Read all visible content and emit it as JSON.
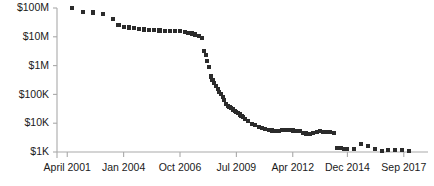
{
  "chart_data": {
    "type": "scatter",
    "title": "",
    "subtitle": "",
    "xlabel": "",
    "ylabel": "",
    "yscale": "log",
    "grid": false,
    "legend": null,
    "marker": "square",
    "marker_color": "#2b2b2b",
    "axis_color": "#a9a9a9",
    "ylim": [
      1000,
      100000000
    ],
    "ytick_labels": [
      "$100M",
      "$10M",
      "$1M",
      "$100K",
      "$10K",
      "$1K"
    ],
    "ytick_values": [
      100000000,
      10000000,
      1000000,
      100000,
      10000,
      1000
    ],
    "xtick_labels": [
      "April 2001",
      "Jan 2004",
      "Oct 2006",
      "Jul 2009",
      "Apr 2012",
      "Dec 2014",
      "Sep 2017"
    ],
    "xtick_positions": [
      0,
      33,
      66,
      99,
      132,
      164,
      197
    ],
    "xlim": [
      -6,
      210
    ],
    "x": [
      3,
      9,
      15,
      21,
      27,
      30,
      33,
      36,
      39,
      42,
      45,
      48,
      51,
      54,
      57,
      60,
      63,
      66,
      69,
      71,
      73,
      75,
      77,
      79,
      80,
      81,
      82,
      83,
      84,
      85,
      86,
      87,
      88,
      89,
      90,
      91,
      92,
      93,
      94,
      95,
      96,
      97,
      98,
      99,
      100,
      101,
      102,
      103,
      104,
      106,
      108,
      110,
      112,
      114,
      116,
      118,
      120,
      122,
      124,
      126,
      128,
      130,
      132,
      134,
      136,
      138,
      140,
      142,
      144,
      146,
      148,
      150,
      152,
      154,
      156,
      158,
      160,
      162,
      164,
      168,
      172,
      176,
      180,
      184,
      188,
      192,
      196,
      200
    ],
    "y": [
      100000000,
      72000000,
      70000000,
      62000000,
      42000000,
      25000000,
      22000000,
      21000000,
      20000000,
      19000000,
      18000000,
      17000000,
      17000000,
      16500000,
      16000000,
      15500000,
      15500000,
      16000000,
      15000000,
      14000000,
      13000000,
      12000000,
      11000000,
      9000000,
      3200000,
      2300000,
      1400000,
      900000,
      420000,
      320000,
      250000,
      200000,
      150000,
      120000,
      100000,
      80000,
      62000,
      46000,
      40000,
      36000,
      33000,
      30000,
      27000,
      24000,
      22000,
      20000,
      18000,
      16000,
      14000,
      12000,
      9500,
      8500,
      7600,
      6800,
      6200,
      5900,
      5600,
      5500,
      5400,
      5700,
      5800,
      5700,
      5600,
      5500,
      5400,
      4600,
      4400,
      4300,
      4500,
      5000,
      5200,
      5000,
      4900,
      4800,
      4700,
      1400,
      1350,
      1300,
      1250,
      1280,
      1900,
      1600,
      1250,
      1100,
      1150,
      1200,
      1150,
      1120
    ]
  },
  "figure": {
    "background_color": "#ffffff",
    "plot_left_px": 57,
    "plot_right_px": 426,
    "plot_top_px": 8,
    "plot_bottom_px": 152
  }
}
